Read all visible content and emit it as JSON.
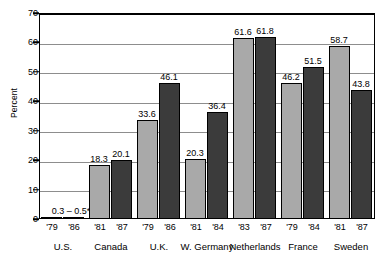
{
  "chart_data": {
    "type": "bar",
    "title": "",
    "xlabel": "",
    "ylabel": "Percent",
    "ylim": [
      0,
      70
    ],
    "yticks": [
      0,
      10,
      20,
      30,
      40,
      50,
      60,
      70
    ],
    "grid": true,
    "legend": "none",
    "categories": [
      "U.S.",
      "Canada",
      "U.K.",
      "W. Germany",
      "Netherlands",
      "France",
      "Sweden"
    ],
    "series": [
      {
        "name": "earlier year",
        "color": "#a9a9a9",
        "years": [
          "'79",
          "'81",
          "'79",
          "'81",
          "'83",
          "'79",
          "'81"
        ],
        "values": [
          0.3,
          18.3,
          33.6,
          20.3,
          61.6,
          46.2,
          58.7
        ],
        "labels": [
          "",
          "18.3",
          "33.6",
          "20.3",
          "61.6",
          "46.2",
          "58.7"
        ]
      },
      {
        "name": "later year",
        "color": "#3b3b3b",
        "years": [
          "'86",
          "'87",
          "'86",
          "'84",
          "'87",
          "'84",
          "'87"
        ],
        "values": [
          0.5,
          20.1,
          46.1,
          36.4,
          61.8,
          51.5,
          43.8
        ],
        "labels": [
          "",
          "20.1",
          "46.1",
          "36.4",
          "61.8",
          "51.5",
          "43.8"
        ]
      }
    ],
    "annotations": [
      {
        "group": "U.S.",
        "text": "0.3 – 0.5*"
      }
    ]
  },
  "axis": {
    "y_title": "Percent",
    "y_tick_labels": [
      "70",
      "60",
      "50",
      "40",
      "30",
      "20",
      "10",
      "0"
    ]
  },
  "groups": [
    {
      "name": "U.S.",
      "year0": "'79",
      "year1": "'86",
      "label0": "",
      "label1": "",
      "note": "0.3 – 0.5*"
    },
    {
      "name": "Canada",
      "year0": "'81",
      "year1": "'87",
      "label0": "18.3",
      "label1": "20.1",
      "note": ""
    },
    {
      "name": "U.K.",
      "year0": "'79",
      "year1": "'86",
      "label0": "33.6",
      "label1": "46.1",
      "note": ""
    },
    {
      "name": "W. Germany",
      "year0": "'81",
      "year1": "'84",
      "label0": "20.3",
      "label1": "36.4",
      "note": ""
    },
    {
      "name": "Netherlands",
      "year0": "'83",
      "year1": "'87",
      "label0": "61.6",
      "label1": "61.8",
      "note": ""
    },
    {
      "name": "France",
      "year0": "'79",
      "year1": "'84",
      "label0": "46.2",
      "label1": "51.5",
      "note": ""
    },
    {
      "name": "Sweden",
      "year0": "'81",
      "year1": "'87",
      "label0": "58.7",
      "label1": "43.8",
      "note": ""
    }
  ]
}
